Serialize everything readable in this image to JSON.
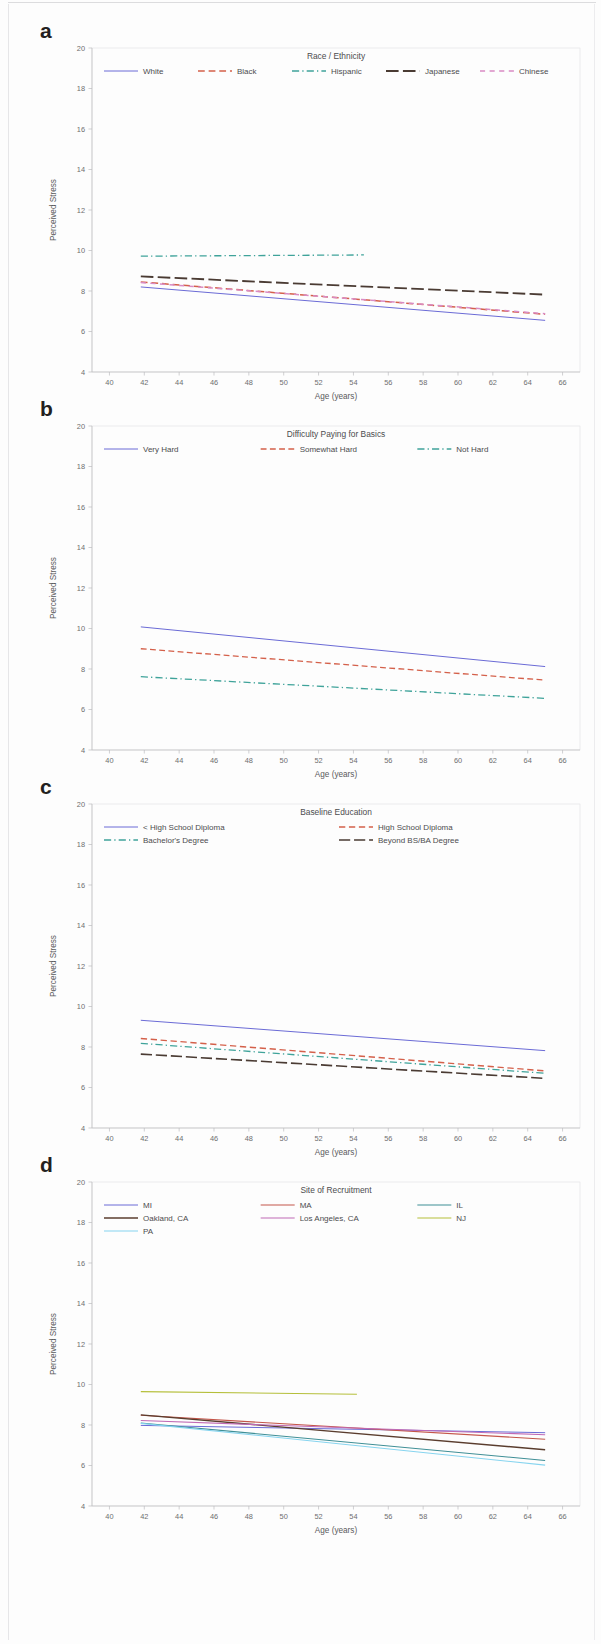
{
  "figure": {
    "shared": {
      "ylabel": "Perceived Stress",
      "xlabel": "Age (years)",
      "xticks": [
        40,
        42,
        44,
        46,
        48,
        50,
        52,
        54,
        56,
        58,
        60,
        62,
        64,
        66
      ],
      "yticks": [
        4,
        6,
        8,
        10,
        12,
        14,
        16,
        18,
        20
      ],
      "xlim": [
        39,
        67
      ],
      "ylim": [
        4,
        20
      ]
    },
    "panels": [
      {
        "letter": "a",
        "legend_title": "Race / Ethnicity",
        "legend_columns": 5,
        "series": [
          {
            "name": "White",
            "color": "#6b6bd6",
            "dash": "none",
            "width": 1.0,
            "x": [
              41.8,
              65.0
            ],
            "y": [
              8.2,
              6.55
            ]
          },
          {
            "name": "Black",
            "color": "#d4604a",
            "dash": "dashed",
            "width": 1.5,
            "x": [
              41.8,
              65.0
            ],
            "y": [
              8.45,
              6.85
            ]
          },
          {
            "name": "Hispanic",
            "color": "#3fa39a",
            "dash": "dashdot",
            "width": 1.3,
            "x": [
              41.8,
              54.6
            ],
            "y": [
              9.72,
              9.78
            ]
          },
          {
            "name": "Japanese",
            "color": "#4a3b33",
            "dash": "longdash",
            "width": 1.8,
            "x": [
              41.8,
              65.0
            ],
            "y": [
              8.72,
              7.82
            ]
          },
          {
            "name": "Chinese",
            "color": "#d98bc4",
            "dash": "widedash",
            "width": 1.5,
            "x": [
              41.8,
              65.0
            ],
            "y": [
              8.42,
              6.88
            ]
          }
        ]
      },
      {
        "letter": "b",
        "legend_title": "Difficulty Paying for Basics",
        "legend_columns": 3,
        "series": [
          {
            "name": "Very Hard",
            "color": "#6b6bd6",
            "dash": "none",
            "width": 1.0,
            "x": [
              41.8,
              65.0
            ],
            "y": [
              10.08,
              8.12
            ]
          },
          {
            "name": "Somewhat Hard",
            "color": "#d4604a",
            "dash": "dashed",
            "width": 1.3,
            "x": [
              41.8,
              65.0
            ],
            "y": [
              9.0,
              7.45
            ]
          },
          {
            "name": "Not Hard",
            "color": "#3fa39a",
            "dash": "dashdot",
            "width": 1.3,
            "x": [
              41.8,
              65.0
            ],
            "y": [
              7.62,
              6.55
            ]
          }
        ]
      },
      {
        "letter": "c",
        "legend_title": "Baseline Education",
        "legend_columns": 2,
        "series": [
          {
            "name": "< High School Diploma",
            "color": "#6b6bd6",
            "dash": "none",
            "width": 1.0,
            "x": [
              41.8,
              65.0
            ],
            "y": [
              9.32,
              7.82
            ]
          },
          {
            "name": "High School Diploma",
            "color": "#d4604a",
            "dash": "dashed",
            "width": 1.4,
            "x": [
              41.8,
              65.0
            ],
            "y": [
              8.42,
              6.82
            ]
          },
          {
            "name": "Bachelor's Degree",
            "color": "#3fa39a",
            "dash": "dashdot",
            "width": 1.3,
            "x": [
              41.8,
              65.0
            ],
            "y": [
              8.18,
              6.7
            ]
          },
          {
            "name": "Beyond BS/BA Degree",
            "color": "#4a3b33",
            "dash": "longdash",
            "width": 1.6,
            "x": [
              41.8,
              65.0
            ],
            "y": [
              7.65,
              6.45
            ]
          }
        ]
      },
      {
        "letter": "d",
        "legend_title": "Site of Recruitment",
        "legend_columns": 3,
        "series": [
          {
            "name": "MI",
            "color": "#6b6bd6",
            "dash": "none",
            "width": 1.0,
            "x": [
              41.8,
              65.0
            ],
            "y": [
              7.98,
              7.62
            ]
          },
          {
            "name": "MA",
            "color": "#c4564a",
            "dash": "none",
            "width": 1.1,
            "x": [
              41.8,
              65.0
            ],
            "y": [
              8.48,
              7.3
            ]
          },
          {
            "name": "IL",
            "color": "#3f8f96",
            "dash": "none",
            "width": 1.1,
            "x": [
              41.8,
              65.0
            ],
            "y": [
              8.1,
              6.25
            ]
          },
          {
            "name": "Oakland, CA",
            "color": "#5a3d2e",
            "dash": "none",
            "width": 1.4,
            "x": [
              41.8,
              65.0
            ],
            "y": [
              8.5,
              6.78
            ]
          },
          {
            "name": "Los Angeles, CA",
            "color": "#c06ab5",
            "dash": "none",
            "width": 1.1,
            "x": [
              41.8,
              65.0
            ],
            "y": [
              8.22,
              7.52
            ]
          },
          {
            "name": "NJ",
            "color": "#b5bf3a",
            "dash": "none",
            "width": 1.1,
            "x": [
              41.8,
              54.2
            ],
            "y": [
              9.65,
              9.52
            ]
          },
          {
            "name": "PA",
            "color": "#86d4ef",
            "dash": "none",
            "width": 1.1,
            "x": [
              41.8,
              65.0
            ],
            "y": [
              8.08,
              6.02
            ]
          }
        ]
      }
    ]
  },
  "chart_data": [
    {
      "type": "line",
      "panel": "a",
      "title": "Race / Ethnicity",
      "xlabel": "Age (years)",
      "ylabel": "Perceived Stress",
      "xlim": [
        39,
        67
      ],
      "ylim": [
        4,
        20
      ],
      "xticks": [
        40,
        42,
        44,
        46,
        48,
        50,
        52,
        54,
        56,
        58,
        60,
        62,
        64,
        66
      ],
      "yticks": [
        4,
        6,
        8,
        10,
        12,
        14,
        16,
        18,
        20
      ],
      "grid": false,
      "legend_position": "top-center",
      "series": [
        {
          "name": "White",
          "x": [
            41.8,
            65.0
          ],
          "values": [
            8.2,
            6.55
          ]
        },
        {
          "name": "Black",
          "x": [
            41.8,
            65.0
          ],
          "values": [
            8.45,
            6.85
          ]
        },
        {
          "name": "Hispanic",
          "x": [
            41.8,
            54.6
          ],
          "values": [
            9.72,
            9.78
          ]
        },
        {
          "name": "Japanese",
          "x": [
            41.8,
            65.0
          ],
          "values": [
            8.72,
            7.82
          ]
        },
        {
          "name": "Chinese",
          "x": [
            41.8,
            65.0
          ],
          "values": [
            8.42,
            6.88
          ]
        }
      ]
    },
    {
      "type": "line",
      "panel": "b",
      "title": "Difficulty Paying for Basics",
      "xlabel": "Age (years)",
      "ylabel": "Perceived Stress",
      "xlim": [
        39,
        67
      ],
      "ylim": [
        4,
        20
      ],
      "xticks": [
        40,
        42,
        44,
        46,
        48,
        50,
        52,
        54,
        56,
        58,
        60,
        62,
        64,
        66
      ],
      "yticks": [
        4,
        6,
        8,
        10,
        12,
        14,
        16,
        18,
        20
      ],
      "grid": false,
      "legend_position": "top-center",
      "series": [
        {
          "name": "Very Hard",
          "x": [
            41.8,
            65.0
          ],
          "values": [
            10.08,
            8.12
          ]
        },
        {
          "name": "Somewhat Hard",
          "x": [
            41.8,
            65.0
          ],
          "values": [
            9.0,
            7.45
          ]
        },
        {
          "name": "Not Hard",
          "x": [
            41.8,
            65.0
          ],
          "values": [
            7.62,
            6.55
          ]
        }
      ]
    },
    {
      "type": "line",
      "panel": "c",
      "title": "Baseline Education",
      "xlabel": "Age (years)",
      "ylabel": "Perceived Stress",
      "xlim": [
        39,
        67
      ],
      "ylim": [
        4,
        20
      ],
      "xticks": [
        40,
        42,
        44,
        46,
        48,
        50,
        52,
        54,
        56,
        58,
        60,
        62,
        64,
        66
      ],
      "yticks": [
        4,
        6,
        8,
        10,
        12,
        14,
        16,
        18,
        20
      ],
      "grid": false,
      "legend_position": "top-center",
      "series": [
        {
          "name": "< High School Diploma",
          "x": [
            41.8,
            65.0
          ],
          "values": [
            9.32,
            7.82
          ]
        },
        {
          "name": "High School Diploma",
          "x": [
            41.8,
            65.0
          ],
          "values": [
            8.42,
            6.82
          ]
        },
        {
          "name": "Bachelor's Degree",
          "x": [
            41.8,
            65.0
          ],
          "values": [
            8.18,
            6.7
          ]
        },
        {
          "name": "Beyond BS/BA Degree",
          "x": [
            41.8,
            65.0
          ],
          "values": [
            7.65,
            6.45
          ]
        }
      ]
    },
    {
      "type": "line",
      "panel": "d",
      "title": "Site of Recruitment",
      "xlabel": "Age (years)",
      "ylabel": "Perceived Stress",
      "xlim": [
        39,
        67
      ],
      "ylim": [
        4,
        20
      ],
      "xticks": [
        40,
        42,
        44,
        46,
        48,
        50,
        52,
        54,
        56,
        58,
        60,
        62,
        64,
        66
      ],
      "yticks": [
        4,
        6,
        8,
        10,
        12,
        14,
        16,
        18,
        20
      ],
      "grid": false,
      "legend_position": "top-center",
      "series": [
        {
          "name": "MI",
          "x": [
            41.8,
            65.0
          ],
          "values": [
            7.98,
            7.62
          ]
        },
        {
          "name": "MA",
          "x": [
            41.8,
            65.0
          ],
          "values": [
            8.48,
            7.3
          ]
        },
        {
          "name": "IL",
          "x": [
            41.8,
            65.0
          ],
          "values": [
            8.1,
            6.25
          ]
        },
        {
          "name": "Oakland, CA",
          "x": [
            41.8,
            65.0
          ],
          "values": [
            8.5,
            6.78
          ]
        },
        {
          "name": "Los Angeles, CA",
          "x": [
            41.8,
            65.0
          ],
          "values": [
            8.22,
            7.52
          ]
        },
        {
          "name": "NJ",
          "x": [
            41.8,
            54.2
          ],
          "values": [
            9.65,
            9.52
          ]
        },
        {
          "name": "PA",
          "x": [
            41.8,
            65.0
          ],
          "values": [
            8.08,
            6.02
          ]
        }
      ]
    }
  ]
}
